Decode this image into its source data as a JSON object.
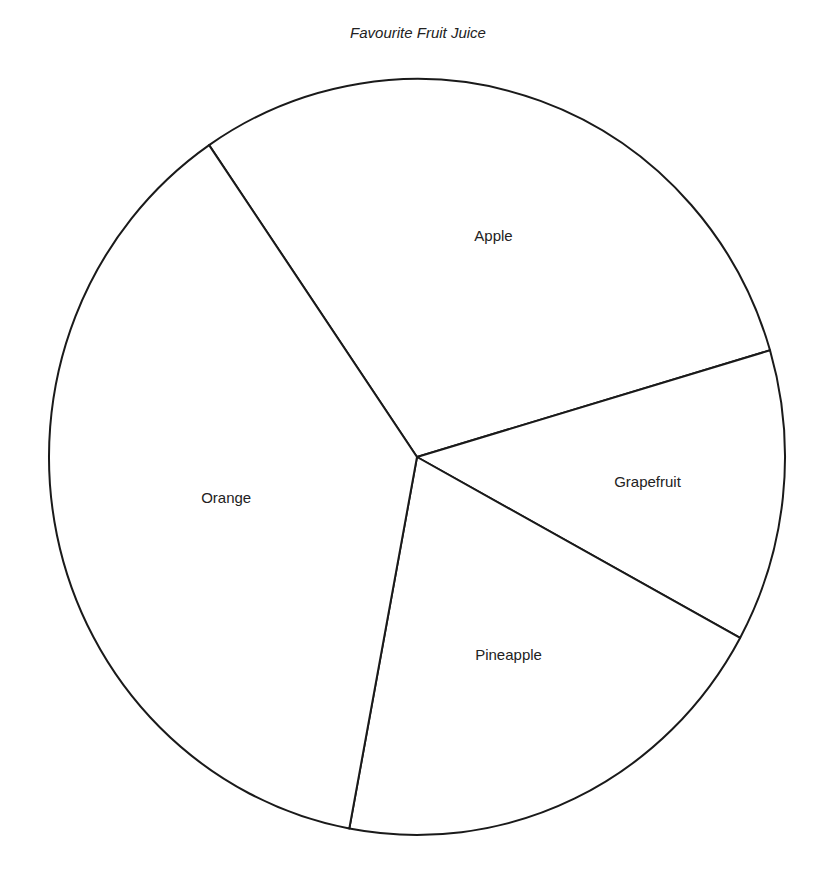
{
  "chart_data": {
    "type": "pie",
    "title": "Favourite Fruit Juice",
    "categories": [
      "Apple",
      "Grapefruit",
      "Pineapple",
      "Orange"
    ],
    "values": [
      30,
      12.5,
      20,
      37.5
    ],
    "unit": "percent (estimated from slice angles)",
    "start_angle_deg": 325.6,
    "direction": "clockwise",
    "legend": "none (labels inside slices)",
    "colors": [
      "#ffffff",
      "#ffffff",
      "#ffffff",
      "#ffffff"
    ],
    "stroke": "#1a1a1a"
  },
  "title": "Favourite Fruit Juice"
}
